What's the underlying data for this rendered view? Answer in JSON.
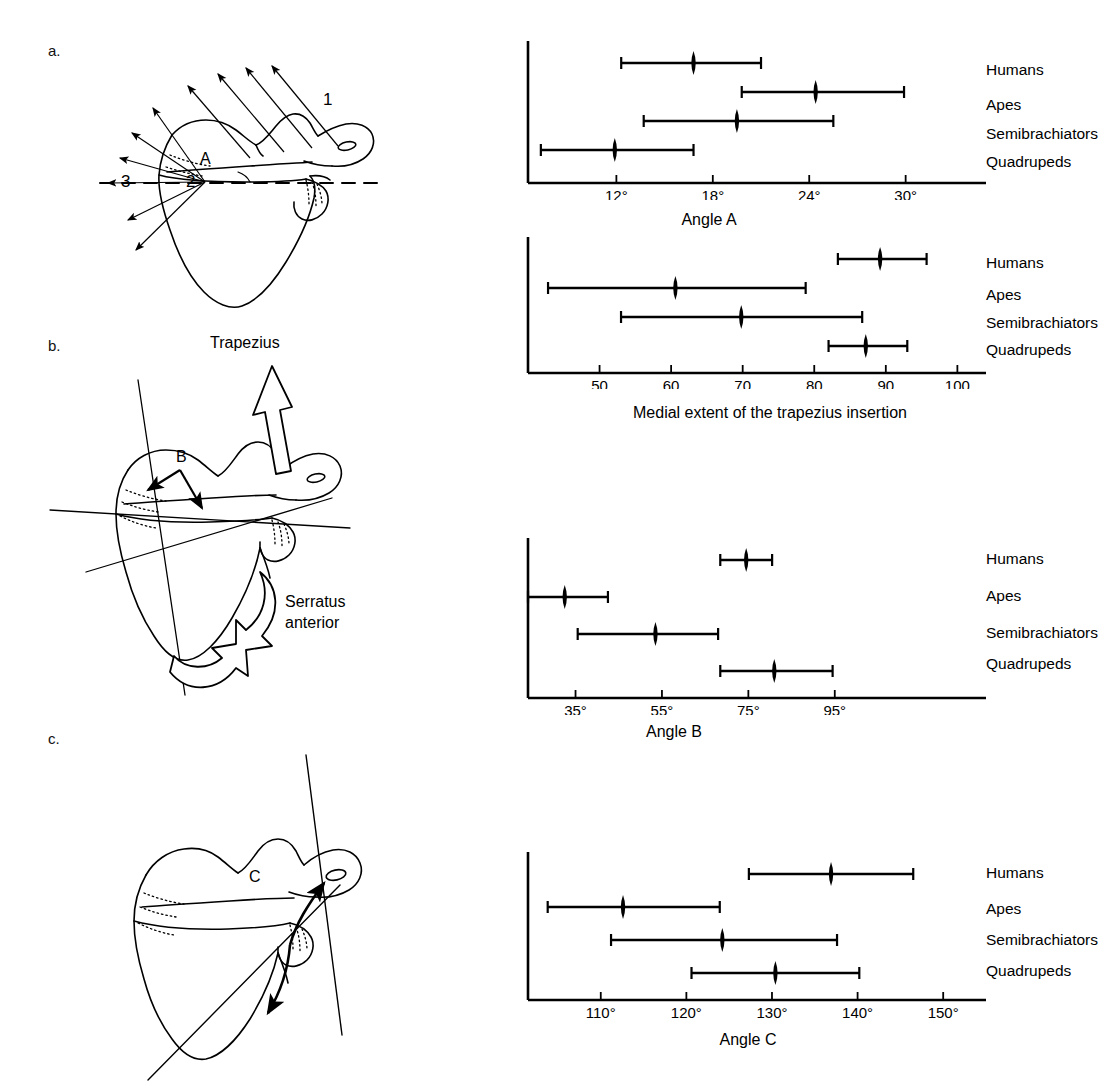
{
  "panels": [
    {
      "id": "a",
      "letter": "a.",
      "labels": [
        "1",
        "2",
        "3",
        "A"
      ]
    },
    {
      "id": "b",
      "letter": "b.",
      "labels": [
        "B"
      ],
      "muscle_labels": [
        "Trapezius",
        "Serratus anterior"
      ]
    },
    {
      "id": "c",
      "letter": "c.",
      "labels": [
        "C"
      ]
    }
  ],
  "diagram_a": {
    "letter": "a.",
    "marker_1": "1",
    "marker_2": "2",
    "marker_3": "3",
    "angle_label": "A"
  },
  "diagram_b": {
    "letter": "b.",
    "trapezius_label": "Trapezius",
    "serratus_label_line1": "Serratus",
    "serratus_label_line2": "anterior",
    "angle_label": "B"
  },
  "diagram_c": {
    "letter": "c.",
    "angle_label": "C"
  },
  "categories": [
    "Humans",
    "Apes",
    "Semibrachiators",
    "Quadrupeds"
  ],
  "chart_data": [
    {
      "type": "range",
      "id": "angle-a",
      "title": "",
      "xlabel": "Angle A",
      "ylabel": "",
      "categories": [
        "Humans",
        "Apes",
        "Semibrachiators",
        "Quadrupeds"
      ],
      "tick_values": [
        12,
        18,
        24,
        30
      ],
      "tick_labels": [
        "12°",
        "18°",
        "24°",
        "30°"
      ],
      "xlim": [
        6.5,
        35
      ],
      "grid": false,
      "legend": "none",
      "series": [
        {
          "name": "Humans",
          "mean": 16.8,
          "min": 12.3,
          "max": 21.0
        },
        {
          "name": "Apes",
          "mean": 24.4,
          "min": 19.8,
          "max": 29.9
        },
        {
          "name": "Semibrachiators",
          "mean": 19.5,
          "min": 13.7,
          "max": 25.5
        },
        {
          "name": "Quadrupeds",
          "mean": 11.9,
          "min": 7.3,
          "max": 16.8
        }
      ]
    },
    {
      "type": "range",
      "id": "trapezius-insertion",
      "title": "",
      "xlabel": "Medial extent of the trapezius insertion",
      "ylabel": "",
      "categories": [
        "Humans",
        "Apes",
        "Semibrachiators",
        "Quadrupeds"
      ],
      "tick_values": [
        50,
        60,
        70,
        80,
        90,
        100
      ],
      "tick_labels": [
        "50",
        "60",
        "70",
        "80",
        "90",
        "100"
      ],
      "xlim": [
        40,
        104
      ],
      "grid": false,
      "legend": "none",
      "series": [
        {
          "name": "Humans",
          "mean": 89.2,
          "min": 83.3,
          "max": 95.7
        },
        {
          "name": "Apes",
          "mean": 60.6,
          "min": 42.8,
          "max": 78.8
        },
        {
          "name": "Semibrachiators",
          "mean": 69.8,
          "min": 53.0,
          "max": 86.7
        },
        {
          "name": "Quadrupeds",
          "mean": 87.2,
          "min": 82.0,
          "max": 93.0
        }
      ]
    },
    {
      "type": "range",
      "id": "angle-b",
      "title": "",
      "xlabel": "Angle B",
      "ylabel": "",
      "categories": [
        "Humans",
        "Apes",
        "Semibrachiators",
        "Quadrupeds"
      ],
      "tick_values": [
        35,
        55,
        75,
        95
      ],
      "tick_labels": [
        "35°",
        "55°",
        "75°",
        "95°"
      ],
      "xlim": [
        24,
        130
      ],
      "grid": false,
      "legend": "none",
      "series": [
        {
          "name": "Humans",
          "mean": 74.5,
          "min": 68.5,
          "max": 80.5
        },
        {
          "name": "Apes",
          "mean": 32.5,
          "min": 24.0,
          "max": 42.5
        },
        {
          "name": "Semibrachiators",
          "mean": 53.5,
          "min": 35.5,
          "max": 68.0
        },
        {
          "name": "Quadrupeds",
          "mean": 81.0,
          "min": 68.5,
          "max": 94.5
        }
      ]
    },
    {
      "type": "range",
      "id": "angle-c",
      "title": "",
      "xlabel": "Angle C",
      "ylabel": "",
      "categories": [
        "Humans",
        "Apes",
        "Semibrachiators",
        "Quadrupeds"
      ],
      "tick_values": [
        110,
        120,
        130,
        140,
        150
      ],
      "tick_labels": [
        "110°",
        "120°",
        "130°",
        "140°",
        "150°"
      ],
      "xlim": [
        101.5,
        155
      ],
      "grid": false,
      "legend": "none",
      "series": [
        {
          "name": "Humans",
          "mean": 136.9,
          "min": 127.3,
          "max": 146.5
        },
        {
          "name": "Apes",
          "mean": 112.6,
          "min": 103.8,
          "max": 123.9
        },
        {
          "name": "Semibrachiators",
          "mean": 124.2,
          "min": 111.2,
          "max": 137.6
        },
        {
          "name": "Quadrupeds",
          "mean": 130.4,
          "min": 120.6,
          "max": 140.2
        }
      ]
    }
  ],
  "colors": {
    "ink": "#000000",
    "background": "#ffffff"
  }
}
